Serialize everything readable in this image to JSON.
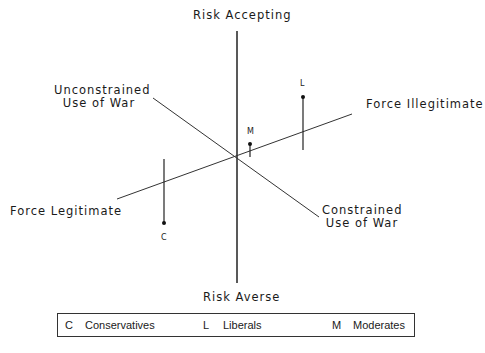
{
  "axes": {
    "top": "Risk Accepting",
    "bottom": "Risk Averse",
    "upper_left": [
      "Unconstrained",
      "Use of War"
    ],
    "lower_right": [
      "Constrained",
      "Use of War"
    ],
    "right": "Force Illegitimate",
    "left": "Force Legitimate"
  },
  "points": {
    "C": "C",
    "L": "L",
    "M": "M"
  },
  "legend": [
    {
      "code": "C",
      "label": "Conservatives"
    },
    {
      "code": "L",
      "label": "Liberals"
    },
    {
      "code": "M",
      "label": "Moderates"
    }
  ]
}
